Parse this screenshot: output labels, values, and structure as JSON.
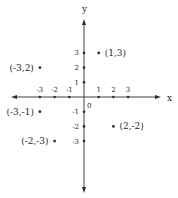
{
  "chart_data": {
    "type": "scatter",
    "title": "",
    "xlabel": "x",
    "ylabel": "y",
    "origin_label": "0",
    "xlim": [
      -3,
      3
    ],
    "ylim": [
      -3,
      3
    ],
    "grid": false,
    "x_ticks": [
      -3,
      -2,
      -1,
      1,
      2,
      3
    ],
    "y_ticks": [
      -3,
      -2,
      -1,
      1,
      2,
      3
    ],
    "x_tick_labels": [
      "-3",
      "-2",
      "-1",
      "1",
      "2",
      "3"
    ],
    "y_tick_labels": [
      "-3",
      "-2",
      "-1",
      "1",
      "2",
      "3"
    ],
    "points": [
      {
        "x": 1,
        "y": 3,
        "label": "(1,3)"
      },
      {
        "x": -3,
        "y": 2,
        "label": "(-3,2)"
      },
      {
        "x": -3,
        "y": -1,
        "label": "(-3,-1)"
      },
      {
        "x": 2,
        "y": -2,
        "label": "(2,-2)"
      },
      {
        "x": -2,
        "y": -3,
        "label": "(-2,-3)"
      }
    ]
  },
  "colors": {
    "ink": "#2a2a2a",
    "background": "#ffffff"
  }
}
